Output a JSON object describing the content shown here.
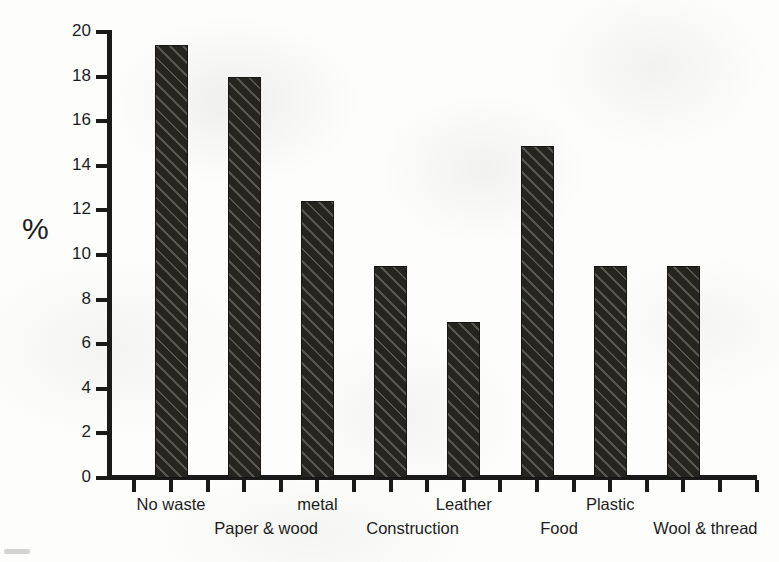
{
  "chart_data": {
    "type": "bar",
    "title": "",
    "xlabel": "",
    "ylabel": "%",
    "ylim": [
      0,
      20
    ],
    "ytick_step": 2,
    "yticks": [
      "0",
      "2",
      "4",
      "6",
      "8",
      "10",
      "12",
      "14",
      "16",
      "18",
      "20"
    ],
    "grid": false,
    "legend": "none",
    "categories": [
      "No waste",
      "Paper & wood",
      "metal",
      "Construction",
      "Leather",
      "Food",
      "Plastic",
      "Wool & thread"
    ],
    "values": [
      19.4,
      18.0,
      12.4,
      9.5,
      7.0,
      14.9,
      9.5,
      9.5
    ],
    "bar_color": "#26241f",
    "bar_hatch": "diagonal-stripes",
    "background_color": "#fdfdfc",
    "axis_color": "#1a1a1a",
    "label_rows": [
      "top",
      "bottom",
      "top",
      "bottom",
      "top",
      "bottom",
      "top",
      "bottom"
    ]
  }
}
